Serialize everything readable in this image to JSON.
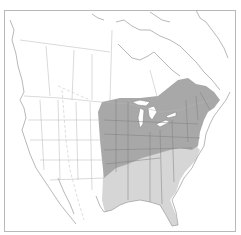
{
  "map": {
    "title": "Range map of North America",
    "region": "North America",
    "colors": {
      "background": "#ffffff",
      "frame": "#b8b8b8",
      "land_outline": "#9a9a9a",
      "border_lines": "#b0b0b0",
      "core_range": "#a8a8a8",
      "secondary_range": "#d6d6d6",
      "state_lines_in_range": "#7e7e7e",
      "water": "#ffffff"
    },
    "legend": [
      {
        "label": "Core range",
        "color": "#a8a8a8"
      },
      {
        "label": "Secondary range",
        "color": "#d6d6d6"
      }
    ]
  }
}
